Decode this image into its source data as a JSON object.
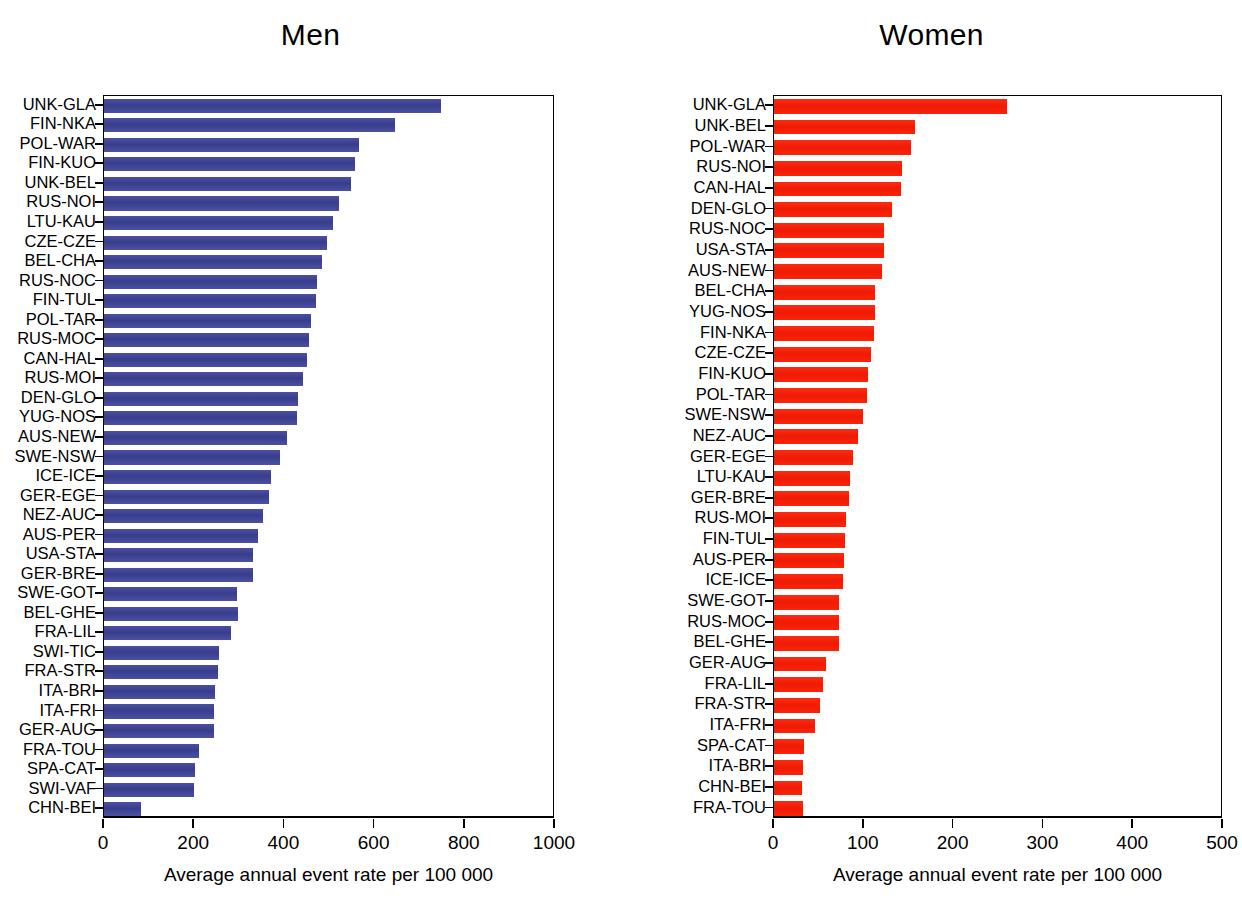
{
  "figure": {
    "width": 1242,
    "height": 905,
    "background": "#ffffff"
  },
  "panels": [
    {
      "key": "men",
      "title": "Men",
      "color": "#3f4595",
      "xlabel": "Average annual event rate per 100 000",
      "xticks": [
        0,
        200,
        400,
        600,
        800,
        1000
      ],
      "xlim": [
        0,
        1000
      ]
    },
    {
      "key": "women",
      "title": "Women",
      "color": "#f7200a",
      "xlabel": "Average annual event rate per 100 000",
      "xticks": [
        0,
        100,
        200,
        300,
        400,
        500
      ],
      "xlim": [
        0,
        500
      ]
    }
  ],
  "chart_data": [
    {
      "type": "bar",
      "orientation": "horizontal",
      "title": "Men",
      "xlabel": "Average annual event rate per 100 000",
      "ylabel": "",
      "xlim": [
        0,
        1000
      ],
      "xticks": [
        0,
        200,
        400,
        600,
        800,
        1000
      ],
      "grid": false,
      "legend": "none",
      "color": "#3f4595",
      "categories": [
        "UNK-GLA",
        "FIN-NKA",
        "POL-WAR",
        "FIN-KUO",
        "UNK-BEL",
        "RUS-NOI",
        "LTU-KAU",
        "CZE-CZE",
        "BEL-CHA",
        "RUS-NOC",
        "FIN-TUL",
        "POL-TAR",
        "RUS-MOC",
        "CAN-HAL",
        "RUS-MOI",
        "DEN-GLO",
        "YUG-NOS",
        "AUS-NEW",
        "SWE-NSW",
        "ICE-ICE",
        "GER-EGE",
        "NEZ-AUC",
        "AUS-PER",
        "USA-STA",
        "GER-BRE",
        "SWE-GOT",
        "BEL-GHE",
        "FRA-LIL",
        "SWI-TIC",
        "FRA-STR",
        "ITA-BRI",
        "ITA-FRI",
        "GER-AUG",
        "FRA-TOU",
        "SPA-CAT",
        "SWI-VAF",
        "CHN-BEI"
      ],
      "values": [
        748,
        645,
        565,
        557,
        548,
        522,
        508,
        495,
        483,
        473,
        470,
        459,
        455,
        450,
        441,
        430,
        428,
        405,
        390,
        370,
        365,
        352,
        342,
        330,
        330,
        295,
        297,
        282,
        255,
        252,
        247,
        243,
        243,
        210,
        202,
        200,
        82
      ]
    },
    {
      "type": "bar",
      "orientation": "horizontal",
      "title": "Women",
      "xlabel": "Average annual event rate per 100 000",
      "ylabel": "",
      "xlim": [
        0,
        500
      ],
      "xticks": [
        0,
        100,
        200,
        300,
        400,
        500
      ],
      "grid": false,
      "legend": "none",
      "color": "#f7200a",
      "categories": [
        "UNK-GLA",
        "UNK-BEL",
        "POL-WAR",
        "RUS-NOI",
        "CAN-HAL",
        "DEN-GLO",
        "RUS-NOC",
        "USA-STA",
        "AUS-NEW",
        "BEL-CHA",
        "YUG-NOS",
        "FIN-NKA",
        "CZE-CZE",
        "FIN-KUO",
        "POL-TAR",
        "SWE-NSW",
        "NEZ-AUC",
        "GER-EGE",
        "LTU-KAU",
        "GER-BRE",
        "RUS-MOI",
        "FIN-TUL",
        "AUS-PER",
        "ICE-ICE",
        "SWE-GOT",
        "RUS-MOC",
        "BEL-GHE",
        "GER-AUG",
        "FRA-LIL",
        "FRA-STR",
        "ITA-FRI",
        "SPA-CAT",
        "ITA-BRI",
        "CHN-BEI",
        "FRA-TOU"
      ],
      "values": [
        260,
        157,
        153,
        142,
        141,
        131,
        122,
        122,
        120,
        113,
        112,
        111,
        108,
        105,
        104,
        99,
        94,
        88,
        85,
        83,
        80,
        79,
        78,
        77,
        72,
        72,
        72,
        58,
        55,
        51,
        46,
        33,
        32,
        31,
        32
      ]
    }
  ]
}
